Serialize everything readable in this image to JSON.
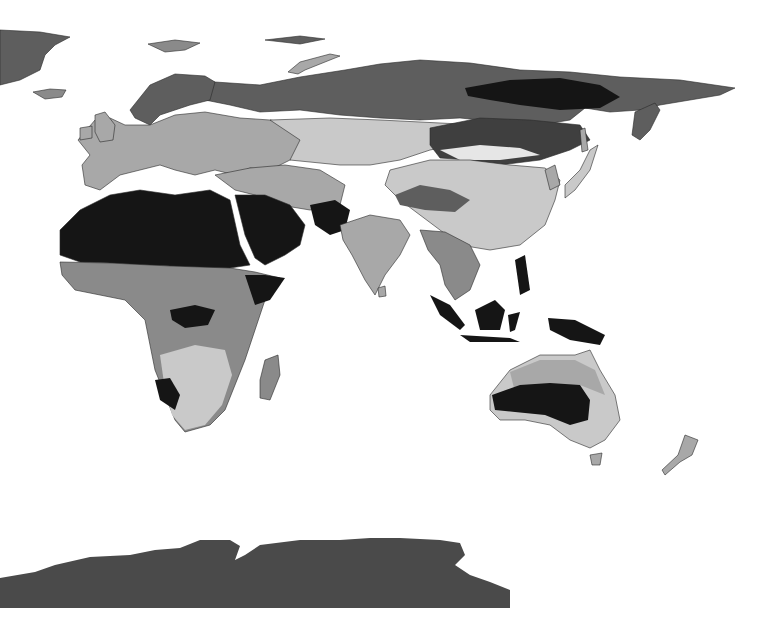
{
  "map": {
    "title": "",
    "projection": "eastern-hemisphere",
    "background": "#ffffff",
    "palette": {
      "class_1_lightest": "#e6e6e6",
      "class_2_light": "#c9c9c9",
      "class_3_mid": "#a8a8a8",
      "class_4_midDark": "#8a8a8a",
      "class_5_dark": "#5e5e5e",
      "class_6_darker": "#3f3f3f",
      "class_7_darkest": "#151515",
      "antarctica": "#4a4a4a",
      "border": "#2a2a2a"
    },
    "regions": [
      {
        "name": "greenland-edge",
        "class": "class_5_dark"
      },
      {
        "name": "iceland",
        "class": "class_4_midDark"
      },
      {
        "name": "scandinavia",
        "class": "class_5_dark"
      },
      {
        "name": "europe",
        "class": "class_3_mid"
      },
      {
        "name": "russia-north",
        "class": "class_5_dark"
      },
      {
        "name": "siberia-core",
        "class": "class_7_darkest"
      },
      {
        "name": "central-asia",
        "class": "class_2_light"
      },
      {
        "name": "sahara-arabia",
        "class": "class_7_darkest"
      },
      {
        "name": "sub-saharan-africa",
        "class": "class_4_midDark"
      },
      {
        "name": "southern-africa",
        "class": "class_2_light"
      },
      {
        "name": "india",
        "class": "class_3_mid"
      },
      {
        "name": "china",
        "class": "class_2_light"
      },
      {
        "name": "southeast-asia",
        "class": "class_4_midDark"
      },
      {
        "name": "indonesia",
        "class": "class_7_darkest"
      },
      {
        "name": "australia-interior",
        "class": "class_7_darkest"
      },
      {
        "name": "australia-coast",
        "class": "class_2_light"
      },
      {
        "name": "new-zealand",
        "class": "class_3_mid"
      },
      {
        "name": "antarctica",
        "class": "antarctica"
      }
    ],
    "legend": null
  }
}
